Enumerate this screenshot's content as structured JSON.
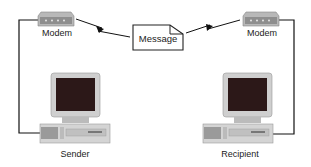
{
  "diagram": {
    "left_modem": {
      "label": "Modem"
    },
    "right_modem": {
      "label": "Modem"
    },
    "message": {
      "label": "Message"
    },
    "sender": {
      "label": "Sender"
    },
    "recipient": {
      "label": "Recipient"
    }
  },
  "colors": {
    "line": "#111111",
    "modem_body": "#a9a9a9",
    "screen": "#2a1515",
    "monitor": "#c8c8c8"
  }
}
